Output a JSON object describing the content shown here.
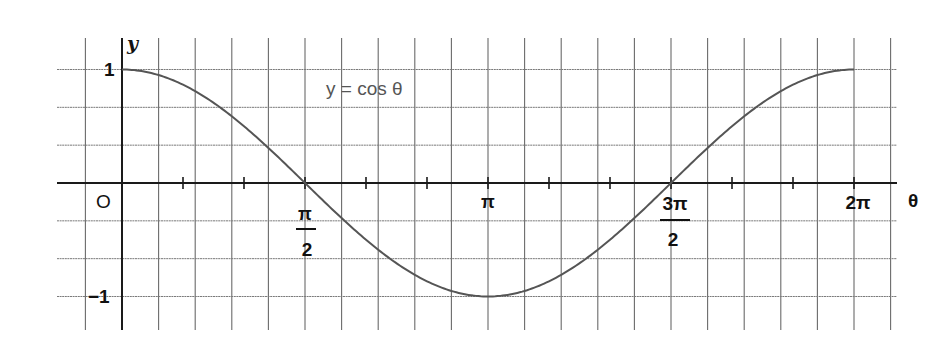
{
  "chart_data": {
    "type": "line",
    "title": "",
    "curve_label": "y = cos θ",
    "xlabel": "θ",
    "ylabel": "y",
    "xlim": [
      -0.3142,
      6.5973
    ],
    "ylim": [
      -1.4,
      1.35
    ],
    "grid": true,
    "grid_x_step": "π/10",
    "grid_y_step": 0.3333,
    "minor_ticks_x_step": "π/6",
    "x_tick_labels": [
      {
        "value": 0,
        "text": "O"
      },
      {
        "value": 1.5708,
        "text": "π/2",
        "numerator": "π",
        "denominator": "2"
      },
      {
        "value": 3.1416,
        "text": "π"
      },
      {
        "value": 4.7124,
        "text": "3π/2",
        "numerator": "3π",
        "denominator": "2"
      },
      {
        "value": 6.2832,
        "text": "2π"
      }
    ],
    "y_tick_labels": [
      {
        "value": 1,
        "text": "1"
      },
      {
        "value": -1,
        "text": "−1"
      }
    ],
    "series": [
      {
        "name": "y = cos θ",
        "function": "cos",
        "x": [
          0,
          0.5236,
          1.0472,
          1.5708,
          2.0944,
          2.618,
          3.1416,
          3.6652,
          4.1888,
          4.7124,
          5.236,
          5.7596,
          6.2832
        ],
        "values": [
          1,
          0.866,
          0.5,
          0,
          -0.5,
          -0.866,
          -1,
          -0.866,
          -0.5,
          0,
          0.5,
          0.866,
          1
        ],
        "color": "#555555"
      }
    ]
  },
  "labels": {
    "y_axis": "y",
    "x_axis": "θ",
    "origin": "O",
    "y_one": "1",
    "y_minus_one": "−1",
    "half_pi_num": "π",
    "half_pi_den": "2",
    "pi": "π",
    "three_half_pi_num": "3π",
    "three_half_pi_den": "2",
    "two_pi": "2π",
    "curve_label": "y = cos θ"
  }
}
